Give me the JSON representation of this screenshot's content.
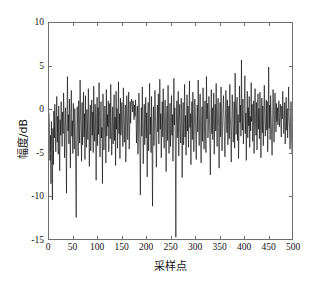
{
  "chart_data": {
    "type": "line",
    "title": "",
    "subtitle": "",
    "xlabel": "采样点",
    "ylabel": "幅度/dB",
    "xlim": [
      0,
      500
    ],
    "ylim": [
      -15,
      10
    ],
    "xticks": [
      0,
      50,
      100,
      150,
      200,
      250,
      300,
      350,
      400,
      450,
      500
    ],
    "yticks": [
      -15,
      -10,
      -5,
      0,
      5,
      10
    ],
    "xtick_labels": [
      "0",
      "50",
      "100",
      "150",
      "200",
      "250",
      "300",
      "350",
      "400",
      "450",
      "500"
    ],
    "ytick_labels": [
      "-15",
      "-10",
      "-5",
      "0",
      "5",
      "10"
    ],
    "grid": false,
    "legend": null,
    "annotations": [],
    "line_color": "#000000",
    "line_width": 0.7,
    "axis_color": "#6e6e6e",
    "background_color": "#ffffff",
    "series": [
      {
        "name": "amplitude",
        "x_start": 0,
        "x_step": 1,
        "values": [
          -0.4,
          -2.1,
          -5.9,
          -3.0,
          -8.6,
          -1.4,
          -4.5,
          -10.5,
          -2.2,
          -6.4,
          -0.2,
          -3.3,
          0.6,
          -2.6,
          -4.9,
          -1.0,
          1.5,
          -3.8,
          -0.8,
          -5.2,
          0.4,
          -2.4,
          -7.1,
          -1.2,
          -3.0,
          0.9,
          -1.6,
          -4.3,
          -0.3,
          -2.8,
          1.9,
          -0.9,
          -5.6,
          -2.0,
          0.2,
          -3.4,
          -9.7,
          -1.1,
          3.8,
          -2.5,
          -0.6,
          -4.0,
          1.2,
          -1.8,
          -6.8,
          -0.4,
          2.2,
          -3.1,
          -1.3,
          -5.1,
          0.7,
          -2.3,
          -4.6,
          0.1,
          -1.9,
          -7.4,
          -12.5,
          -3.6,
          0.3,
          -2.0,
          -5.4,
          1.0,
          -1.5,
          -3.9,
          3.4,
          -0.7,
          -2.7,
          -6.0,
          0.8,
          -4.1,
          -1.4,
          2.0,
          -3.2,
          -0.5,
          -5.8,
          1.6,
          -2.2,
          -4.4,
          0.0,
          -1.7,
          -3.5,
          2.4,
          -0.9,
          -6.6,
          -2.6,
          0.5,
          -4.8,
          -1.2,
          1.1,
          -3.0,
          -0.3,
          -5.0,
          2.7,
          -1.9,
          -3.7,
          0.6,
          -2.4,
          -8.2,
          -1.0,
          1.4,
          -4.2,
          0.2,
          -2.9,
          3.1,
          -0.8,
          -5.5,
          -1.6,
          0.9,
          -3.3,
          -2.1,
          -8.6,
          1.8,
          -0.4,
          -4.7,
          -2.5,
          0.4,
          -1.3,
          -6.2,
          2.3,
          -3.1,
          -0.6,
          -2.0,
          1.0,
          -4.9,
          -1.8,
          0.7,
          -3.4,
          2.9,
          -1.1,
          -5.3,
          -2.7,
          0.3,
          -4.0,
          -1.5,
          1.7,
          -3.6,
          -0.9,
          -6.5,
          2.1,
          -2.3,
          0.1,
          -4.5,
          -1.2,
          3.2,
          -2.8,
          -0.5,
          -5.7,
          1.3,
          -3.0,
          -1.7,
          0.8,
          -2.2,
          -4.3,
          2.5,
          -0.7,
          -3.8,
          -1.4,
          0.5,
          -6.1,
          -2.6,
          1.6,
          -0.2,
          -3.5,
          -1.0,
          2.0,
          -4.6,
          -2.4,
          0.9,
          -1.6,
          0.3,
          1.2,
          0.7,
          -0.3,
          1.0,
          0.1,
          -1.2,
          0.5,
          -0.8,
          1.1,
          -0.1,
          -3.9,
          -1.5,
          0.4,
          -5.2,
          -2.0,
          1.9,
          -0.6,
          -4.4,
          -9.9,
          -2.8,
          0.2,
          -3.1,
          2.6,
          -1.3,
          -6.3,
          -2.2,
          0.6,
          -4.1,
          -1.8,
          1.4,
          -3.3,
          -0.4,
          -7.8,
          -2.5,
          0.8,
          -4.8,
          -1.1,
          3.0,
          -2.9,
          -0.9,
          -5.0,
          1.5,
          -3.7,
          -11.2,
          -2.1,
          0.3,
          -4.2,
          -1.6,
          2.2,
          -0.7,
          -3.4,
          -6.7,
          -1.9,
          0.5,
          -2.6,
          1.8,
          -4.0,
          -1.2,
          3.5,
          -2.3,
          -0.5,
          -5.6,
          -1.4,
          0.9,
          -3.2,
          2.4,
          -1.7,
          -4.5,
          -0.8,
          1.1,
          -2.8,
          -7.2,
          -1.0,
          0.4,
          -3.6,
          2.8,
          -1.5,
          -5.1,
          -2.2,
          0.7,
          -4.3,
          -1.3,
          1.6,
          -3.0,
          -0.6,
          -6.0,
          -2.4,
          3.6,
          -1.8,
          0.2,
          -4.7,
          -14.8,
          -2.0,
          1.0,
          -3.3,
          -0.9,
          2.1,
          -5.4,
          -1.5,
          0.6,
          -2.7,
          -3.9,
          1.3,
          -0.3,
          -7.9,
          -2.2,
          0.8,
          -4.1,
          -1.1,
          2.9,
          -3.2,
          -0.7,
          -5.3,
          -1.9,
          1.7,
          -2.5,
          0.4,
          -4.4,
          -1.3,
          3.3,
          -2.1,
          -0.5,
          -6.4,
          -1.6,
          0.9,
          -3.5,
          2.0,
          -1.0,
          -4.9,
          -2.3,
          1.2,
          -0.2,
          -3.1,
          -5.8,
          -1.7,
          0.5,
          -2.6,
          3.4,
          -1.2,
          -4.2,
          -0.8,
          1.8,
          -2.9,
          -6.2,
          -1.4,
          0.3,
          -3.7,
          2.5,
          -0.6,
          -4.6,
          -1.9,
          1.0,
          -2.4,
          -5.0,
          3.8,
          -1.1,
          0.7,
          -3.3,
          -2.0,
          1.5,
          -0.4,
          -4.0,
          -7.6,
          -1.6,
          2.3,
          -2.8,
          0.2,
          -3.5,
          -1.2,
          1.9,
          -5.2,
          -0.9,
          0.6,
          -2.5,
          3.0,
          -1.8,
          -4.3,
          -0.3,
          1.3,
          -2.1,
          -6.8,
          -1.5,
          0.8,
          -3.2,
          2.6,
          -1.0,
          -4.8,
          -2.2,
          0.1,
          1.6,
          -0.7,
          -3.0,
          -5.5,
          -1.3,
          2.2,
          -0.5,
          -2.7,
          1.1,
          -4.1,
          -1.8,
          0.4,
          -3.4,
          2.9,
          -0.8,
          -2.3,
          -6.1,
          -1.4,
          1.7,
          -0.2,
          -3.8,
          -2.6,
          0.9,
          -4.5,
          4.2,
          -1.1,
          -2.9,
          0.3,
          1.4,
          -3.6,
          -0.6,
          -5.7,
          -2.0,
          2.7,
          -1.5,
          0.5,
          -3.1,
          5.7,
          -0.9,
          -2.4,
          1.2,
          -4.0,
          -1.7,
          0.7,
          3.9,
          -2.8,
          -0.4,
          -5.9,
          -1.2,
          2.1,
          -3.3,
          0.2,
          -1.9,
          1.5,
          -4.4,
          -0.8,
          -2.5,
          3.1,
          -1.4,
          0.6,
          -3.7,
          -2.1,
          1.0,
          -5.1,
          -0.5,
          2.4,
          -1.6,
          -3.0,
          0.8,
          -4.7,
          -1.1,
          1.8,
          -2.3,
          0.1,
          -3.4,
          2.0,
          -0.7,
          -5.6,
          -1.9,
          1.3,
          -2.7,
          0.4,
          -4.2,
          -1.3,
          2.8,
          -0.3,
          -3.1,
          -1.7,
          1.1,
          -2.4,
          0.9,
          -4.9,
          -1.0,
          4.9,
          -2.2,
          0.5,
          -3.5,
          1.6,
          -0.6,
          -2.9,
          -5.3,
          -1.5,
          2.3,
          0.3,
          -3.8,
          -1.2,
          1.9,
          -0.1,
          -2.6,
          0.7,
          -1.4,
          0.2,
          -1.8,
          -0.4,
          1.0,
          -2.0,
          -0.9,
          0.6,
          -1.6,
          -3.2,
          0.4,
          -1.1,
          2.1,
          -0.5,
          -2.8,
          -1.3,
          0.8,
          -4.0,
          -1.7,
          1.4,
          -2.4,
          0.1,
          -3.3,
          -1.0,
          2.6,
          -0.7,
          -2.1,
          -4.6,
          -1.5,
          0.9,
          -3.0,
          -5.2
        ]
      }
    ]
  }
}
